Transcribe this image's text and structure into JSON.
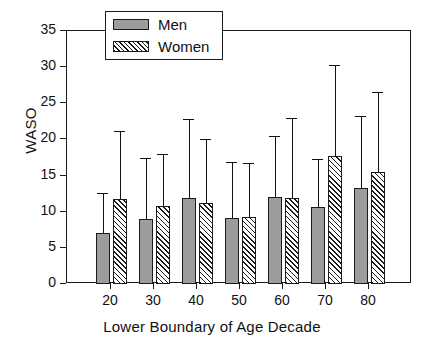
{
  "chart_data": {
    "type": "bar",
    "title": "",
    "subtitle": "",
    "xlabel": "Lower Boundary of Age Decade",
    "ylabel": "WASO",
    "categories": [
      "20",
      "30",
      "40",
      "50",
      "60",
      "70",
      "80"
    ],
    "ylim": [
      0,
      35
    ],
    "yticks": [
      0,
      5,
      10,
      15,
      20,
      25,
      30,
      35
    ],
    "ytick_labels": [
      "0",
      "5",
      "10",
      "15",
      "20",
      "25",
      "30",
      "35"
    ],
    "grid": false,
    "legend_position": "top-left-overlapping-frame",
    "error_bars": "upper-only",
    "series": [
      {
        "name": "Men",
        "fill": "solid-gray",
        "color": "#9c9c9c",
        "values": [
          7.1,
          9.0,
          11.9,
          9.1,
          12.0,
          10.7,
          13.3
        ],
        "error_upper": [
          12.6,
          17.4,
          22.8,
          16.9,
          20.5,
          17.3,
          23.2
        ]
      },
      {
        "name": "Women",
        "fill": "diagonal-hatch",
        "color": "#ffffff",
        "values": [
          11.8,
          10.8,
          11.2,
          9.2,
          11.9,
          17.7,
          15.5
        ],
        "error_upper": [
          21.1,
          18.0,
          20.1,
          16.8,
          23.0,
          30.3,
          26.5
        ]
      }
    ]
  },
  "legend": {
    "items": [
      {
        "label": "Men"
      },
      {
        "label": "Women"
      }
    ]
  },
  "axes": {
    "frame_color": "#1a1a1a"
  }
}
